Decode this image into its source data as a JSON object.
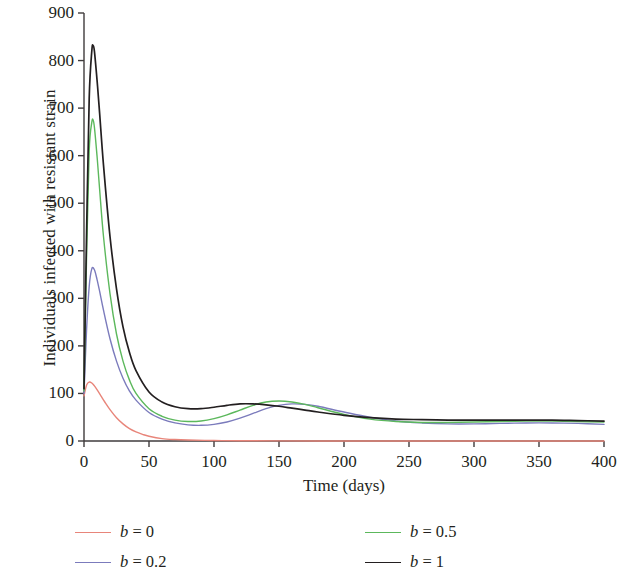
{
  "chart_data": {
    "type": "line",
    "title": "",
    "xlabel": "Time (days)",
    "ylabel": "Individuals infected with resistant strain",
    "xlim": [
      0,
      400
    ],
    "ylim": [
      0,
      900
    ],
    "xticks": [
      0,
      50,
      100,
      150,
      200,
      250,
      300,
      350,
      400
    ],
    "yticks": [
      0,
      100,
      200,
      300,
      400,
      500,
      600,
      700,
      800,
      900
    ],
    "grid": false,
    "legend_position": "below-axes",
    "series": [
      {
        "name": "b = 0",
        "label_var": "b",
        "label_value": "0",
        "color": "#e8857a",
        "x": [
          0,
          2,
          4,
          6,
          8,
          10,
          13,
          16,
          20,
          25,
          30,
          35,
          40,
          45,
          50,
          60,
          70,
          80,
          100,
          120,
          150,
          200,
          250,
          300,
          350,
          400
        ],
        "y": [
          95,
          118,
          124,
          122,
          116,
          108,
          95,
          82,
          66,
          49,
          36,
          26,
          19,
          14,
          10,
          5,
          3,
          2,
          1,
          0.5,
          0.3,
          0.1,
          0.1,
          0,
          0,
          0
        ]
      },
      {
        "name": "b = 0.2",
        "label_var": "b",
        "label_value": "0.2",
        "color": "#7b7bbc",
        "x": [
          0,
          2,
          4,
          6,
          8,
          10,
          12,
          15,
          20,
          25,
          30,
          35,
          40,
          50,
          60,
          70,
          80,
          90,
          100,
          110,
          120,
          130,
          140,
          150,
          160,
          170,
          180,
          200,
          220,
          240,
          260,
          280,
          300,
          320,
          340,
          360,
          380,
          400
        ],
        "y": [
          100,
          235,
          325,
          362,
          360,
          340,
          315,
          275,
          215,
          168,
          132,
          105,
          86,
          60,
          46,
          38,
          34,
          33,
          35,
          40,
          48,
          58,
          68,
          75,
          78,
          77,
          73,
          61,
          50,
          42,
          38,
          36,
          36,
          37,
          38,
          38,
          37,
          35
        ]
      },
      {
        "name": "b = 0.5",
        "label_var": "b",
        "label_value": "0.5",
        "color": "#5cb85c",
        "x": [
          0,
          2,
          4,
          6,
          7,
          8,
          10,
          12,
          15,
          20,
          25,
          30,
          35,
          40,
          50,
          60,
          70,
          80,
          90,
          100,
          110,
          120,
          130,
          140,
          150,
          160,
          170,
          180,
          200,
          220,
          240,
          260,
          280,
          300,
          320,
          340,
          360,
          380,
          400
        ],
        "y": [
          105,
          390,
          610,
          670,
          675,
          660,
          600,
          530,
          430,
          310,
          225,
          168,
          128,
          100,
          68,
          52,
          44,
          41,
          42,
          47,
          55,
          65,
          75,
          82,
          84,
          82,
          77,
          70,
          56,
          46,
          41,
          39,
          39,
          40,
          41,
          42,
          42,
          41,
          40
        ]
      },
      {
        "name": "b = 1",
        "label_var": "b",
        "label_value": "1",
        "color": "#231f20",
        "x": [
          0,
          2,
          4,
          6,
          7,
          8,
          10,
          12,
          15,
          20,
          25,
          30,
          35,
          40,
          50,
          60,
          70,
          80,
          90,
          100,
          110,
          120,
          130,
          140,
          150,
          160,
          170,
          180,
          200,
          220,
          240,
          260,
          280,
          300,
          320,
          340,
          360,
          380,
          400
        ],
        "y": [
          110,
          440,
          720,
          820,
          832,
          820,
          760,
          690,
          580,
          430,
          320,
          240,
          186,
          148,
          103,
          82,
          72,
          68,
          68,
          71,
          75,
          78,
          78,
          76,
          73,
          69,
          65,
          61,
          54,
          49,
          46,
          45,
          44,
          44,
          44,
          44,
          44,
          43,
          42
        ]
      }
    ]
  },
  "axes": {
    "y_tick_labels": [
      "900",
      "800",
      "700",
      "600",
      "500",
      "400",
      "300",
      "200",
      "100",
      "0"
    ],
    "x_tick_labels": [
      "0",
      "50",
      "100",
      "150",
      "200",
      "250",
      "300",
      "350",
      "400"
    ],
    "x_axis_title": "Time (days)",
    "y_axis_title": "Individuals infected with resistant strain"
  },
  "legend": {
    "items": [
      {
        "var": "b",
        "eq": "=",
        "value": "0",
        "text": "b = 0",
        "color": "#e8857a"
      },
      {
        "var": "b",
        "eq": "=",
        "value": "0.2",
        "text": "b = 0.2",
        "color": "#7b7bbc"
      },
      {
        "var": "b",
        "eq": "=",
        "value": "0.5",
        "text": "b = 0.5",
        "color": "#5cb85c"
      },
      {
        "var": "b",
        "eq": "=",
        "value": "1",
        "text": "b = 1",
        "color": "#231f20"
      }
    ]
  },
  "colors": {
    "axis": "#3f3b3c",
    "text": "#231f20",
    "background": "#ffffff"
  }
}
